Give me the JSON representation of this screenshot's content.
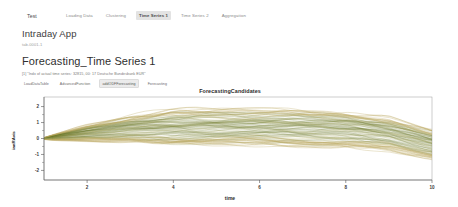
{
  "navbar": {
    "brand": "Test",
    "items": [
      {
        "label": "Loading Data",
        "active": false
      },
      {
        "label": "Clustering",
        "active": false
      },
      {
        "label": "Time Series 1",
        "active": true
      },
      {
        "label": "Time Series 2",
        "active": false
      },
      {
        "label": "Aggregation",
        "active": false
      }
    ]
  },
  "header": {
    "app_title": "Intraday App",
    "app_subtitle": "tab-0001-1"
  },
  "section": {
    "title": "Forecasting_Time Series 1",
    "note1": "[1] \"Indx of actual time series: 32815, 00: 17 Deutsche Bundesbank EUR\"",
    "note2": "[1] \"The second Cluster is  -h: 0\"",
    "buttons": [
      {
        "label": "LoadDataTable",
        "boxed": false
      },
      {
        "label": "AdvancedFunction",
        "boxed": false
      },
      {
        "label": "addODFForecasting",
        "boxed": true
      },
      {
        "label": "Forecasting",
        "boxed": false
      }
    ]
  },
  "chart_data": {
    "type": "line",
    "title": "ForecastingCandidates",
    "xlabel": "time",
    "ylabel": "ianRAvis",
    "xlim": [
      1,
      10
    ],
    "ylim": [
      -2.6,
      2.6
    ],
    "xticks": [
      2,
      4,
      6,
      8,
      10
    ],
    "yticks": [
      -2,
      -1,
      0,
      1,
      2
    ],
    "grid": false,
    "legend": false,
    "n_series": 120,
    "colors": {
      "bundle_main": "#6b7328",
      "bundle_light": "#c7bb7a",
      "outlier": "#b9a45c",
      "axis": "#555555",
      "panel_border": "#9a9a9a"
    },
    "series": [
      {
        "name": "candidate-band-center",
        "x": [
          1,
          2,
          3,
          4,
          5,
          6,
          7,
          8,
          9,
          10
        ],
        "values": [
          0.0,
          0.35,
          0.6,
          0.7,
          0.72,
          0.7,
          0.65,
          0.55,
          0.3,
          -0.35
        ]
      },
      {
        "name": "candidate-band-upper",
        "x": [
          1,
          2,
          3,
          4,
          5,
          6,
          7,
          8,
          9,
          10
        ],
        "values": [
          0.15,
          0.95,
          1.25,
          1.35,
          1.3,
          1.25,
          1.2,
          1.1,
          0.85,
          0.35
        ]
      },
      {
        "name": "candidate-band-lower",
        "x": [
          1,
          2,
          3,
          4,
          5,
          6,
          7,
          8,
          9,
          10
        ],
        "values": [
          -0.15,
          -0.25,
          -0.1,
          0.05,
          0.1,
          0.1,
          0.05,
          -0.05,
          -0.35,
          -1.05
        ]
      },
      {
        "name": "outlier-high",
        "x": [
          1,
          2,
          3,
          4,
          5,
          6,
          7,
          8,
          9,
          10
        ],
        "values": [
          0.1,
          1.55,
          1.35,
          0.95,
          1.45,
          1.6,
          1.45,
          1.3,
          1.1,
          0.55
        ]
      },
      {
        "name": "outlier-low",
        "x": [
          1,
          2,
          3,
          4,
          5,
          6,
          7,
          8,
          9,
          10
        ],
        "values": [
          -0.1,
          -0.55,
          -0.45,
          -0.3,
          -0.2,
          -0.3,
          -0.45,
          -0.5,
          -0.8,
          -1.4
        ]
      }
    ]
  }
}
